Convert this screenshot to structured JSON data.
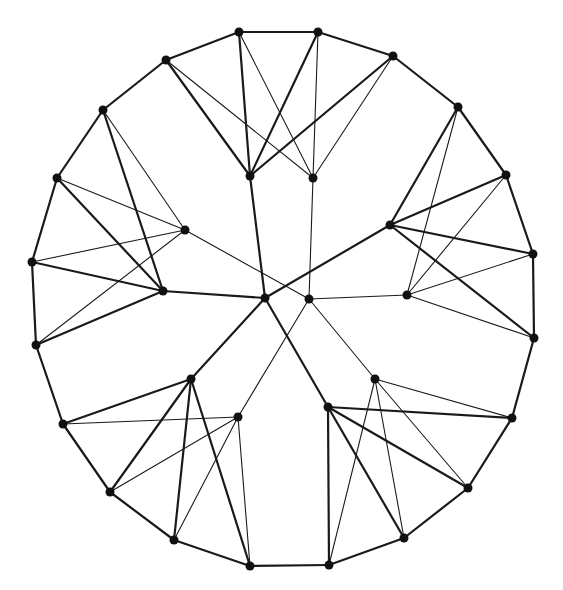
{
  "diagram": {
    "type": "graph",
    "colors": {
      "edge": "#1a1a1a",
      "node": "#111111",
      "background": "#ffffff"
    },
    "node_radius": 4.5,
    "nodes": [
      {
        "id": "A",
        "x": 239,
        "y": 32
      },
      {
        "id": "B",
        "x": 318,
        "y": 32
      },
      {
        "id": "C",
        "x": 166,
        "y": 60
      },
      {
        "id": "D",
        "x": 393,
        "y": 56
      },
      {
        "id": "E",
        "x": 250,
        "y": 176
      },
      {
        "id": "F",
        "x": 313,
        "y": 178
      },
      {
        "id": "G",
        "x": 103,
        "y": 110
      },
      {
        "id": "H",
        "x": 57,
        "y": 178
      },
      {
        "id": "I",
        "x": 185,
        "y": 230
      },
      {
        "id": "J",
        "x": 32,
        "y": 262
      },
      {
        "id": "K",
        "x": 163,
        "y": 291
      },
      {
        "id": "L",
        "x": 36,
        "y": 345
      },
      {
        "id": "M",
        "x": 265,
        "y": 298
      },
      {
        "id": "N",
        "x": 309,
        "y": 299
      },
      {
        "id": "P",
        "x": 390,
        "y": 225
      },
      {
        "id": "Q",
        "x": 407,
        "y": 295
      },
      {
        "id": "T",
        "x": 458,
        "y": 107
      },
      {
        "id": "U",
        "x": 506,
        "y": 175
      },
      {
        "id": "V",
        "x": 533,
        "y": 254
      },
      {
        "id": "W",
        "x": 534,
        "y": 338
      },
      {
        "id": "R",
        "x": 191,
        "y": 379
      },
      {
        "id": "X",
        "x": 63,
        "y": 424
      },
      {
        "id": "Y",
        "x": 238,
        "y": 417
      },
      {
        "id": "Z",
        "x": 110,
        "y": 492
      },
      {
        "id": "AA",
        "x": 174,
        "y": 540
      },
      {
        "id": "AB",
        "x": 250,
        "y": 566
      },
      {
        "id": "S",
        "x": 328,
        "y": 407
      },
      {
        "id": "AC",
        "x": 375,
        "y": 379
      },
      {
        "id": "AD",
        "x": 512,
        "y": 418
      },
      {
        "id": "AE",
        "x": 468,
        "y": 488
      },
      {
        "id": "AF",
        "x": 404,
        "y": 538
      },
      {
        "id": "AG",
        "x": 329,
        "y": 565
      }
    ],
    "edges": [
      {
        "from": "A",
        "to": "B",
        "weight": "thick"
      },
      {
        "from": "B",
        "to": "D",
        "weight": "thick"
      },
      {
        "from": "C",
        "to": "A",
        "weight": "thick"
      },
      {
        "from": "C",
        "to": "G",
        "weight": "thick"
      },
      {
        "from": "G",
        "to": "H",
        "weight": "thick"
      },
      {
        "from": "H",
        "to": "J",
        "weight": "thick"
      },
      {
        "from": "J",
        "to": "L",
        "weight": "thick"
      },
      {
        "from": "L",
        "to": "X",
        "weight": "thick"
      },
      {
        "from": "X",
        "to": "Z",
        "weight": "thick"
      },
      {
        "from": "Z",
        "to": "AA",
        "weight": "thick"
      },
      {
        "from": "AA",
        "to": "AB",
        "weight": "thick"
      },
      {
        "from": "AB",
        "to": "AG",
        "weight": "thick"
      },
      {
        "from": "AG",
        "to": "AF",
        "weight": "thick"
      },
      {
        "from": "AF",
        "to": "AE",
        "weight": "thick"
      },
      {
        "from": "AE",
        "to": "AD",
        "weight": "thick"
      },
      {
        "from": "AD",
        "to": "W",
        "weight": "thick"
      },
      {
        "from": "W",
        "to": "V",
        "weight": "thick"
      },
      {
        "from": "V",
        "to": "U",
        "weight": "thick"
      },
      {
        "from": "U",
        "to": "T",
        "weight": "thick"
      },
      {
        "from": "T",
        "to": "D",
        "weight": "thick"
      },
      {
        "from": "A",
        "to": "E",
        "weight": "thick"
      },
      {
        "from": "B",
        "to": "E",
        "weight": "thick"
      },
      {
        "from": "C",
        "to": "E",
        "weight": "thick"
      },
      {
        "from": "D",
        "to": "E",
        "weight": "thick"
      },
      {
        "from": "A",
        "to": "F",
        "weight": "thin"
      },
      {
        "from": "B",
        "to": "F",
        "weight": "thin"
      },
      {
        "from": "C",
        "to": "F",
        "weight": "thin"
      },
      {
        "from": "D",
        "to": "F",
        "weight": "thin"
      },
      {
        "from": "G",
        "to": "K",
        "weight": "thick"
      },
      {
        "from": "H",
        "to": "K",
        "weight": "thick"
      },
      {
        "from": "J",
        "to": "K",
        "weight": "thick"
      },
      {
        "from": "L",
        "to": "K",
        "weight": "thick"
      },
      {
        "from": "G",
        "to": "I",
        "weight": "thin"
      },
      {
        "from": "H",
        "to": "I",
        "weight": "thin"
      },
      {
        "from": "J",
        "to": "I",
        "weight": "thin"
      },
      {
        "from": "L",
        "to": "I",
        "weight": "thin"
      },
      {
        "from": "T",
        "to": "P",
        "weight": "thick"
      },
      {
        "from": "U",
        "to": "P",
        "weight": "thick"
      },
      {
        "from": "V",
        "to": "P",
        "weight": "thick"
      },
      {
        "from": "W",
        "to": "P",
        "weight": "thick"
      },
      {
        "from": "T",
        "to": "Q",
        "weight": "thin"
      },
      {
        "from": "U",
        "to": "Q",
        "weight": "thin"
      },
      {
        "from": "V",
        "to": "Q",
        "weight": "thin"
      },
      {
        "from": "W",
        "to": "Q",
        "weight": "thin"
      },
      {
        "from": "X",
        "to": "R",
        "weight": "thick"
      },
      {
        "from": "Z",
        "to": "R",
        "weight": "thick"
      },
      {
        "from": "AA",
        "to": "R",
        "weight": "thick"
      },
      {
        "from": "AB",
        "to": "R",
        "weight": "thick"
      },
      {
        "from": "X",
        "to": "Y",
        "weight": "thin"
      },
      {
        "from": "Z",
        "to": "Y",
        "weight": "thin"
      },
      {
        "from": "AA",
        "to": "Y",
        "weight": "thin"
      },
      {
        "from": "AB",
        "to": "Y",
        "weight": "thin"
      },
      {
        "from": "AD",
        "to": "S",
        "weight": "thick"
      },
      {
        "from": "AE",
        "to": "S",
        "weight": "thick"
      },
      {
        "from": "AF",
        "to": "S",
        "weight": "thick"
      },
      {
        "from": "AG",
        "to": "S",
        "weight": "thick"
      },
      {
        "from": "AD",
        "to": "AC",
        "weight": "thin"
      },
      {
        "from": "AE",
        "to": "AC",
        "weight": "thin"
      },
      {
        "from": "AF",
        "to": "AC",
        "weight": "thin"
      },
      {
        "from": "AG",
        "to": "AC",
        "weight": "thin"
      },
      {
        "from": "M",
        "to": "E",
        "weight": "thick"
      },
      {
        "from": "M",
        "to": "K",
        "weight": "thick"
      },
      {
        "from": "M",
        "to": "P",
        "weight": "thick"
      },
      {
        "from": "M",
        "to": "R",
        "weight": "thick"
      },
      {
        "from": "M",
        "to": "S",
        "weight": "thick"
      },
      {
        "from": "N",
        "to": "F",
        "weight": "thin"
      },
      {
        "from": "N",
        "to": "I",
        "weight": "thin"
      },
      {
        "from": "N",
        "to": "Q",
        "weight": "thin"
      },
      {
        "from": "N",
        "to": "Y",
        "weight": "thin"
      },
      {
        "from": "N",
        "to": "AC",
        "weight": "thin"
      }
    ]
  }
}
